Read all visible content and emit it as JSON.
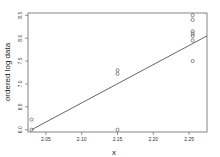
{
  "chart_data": {
    "type": "scatter",
    "title": "",
    "xlabel": "x",
    "ylabel": "ordered log data",
    "xlim": [
      2.025,
      2.275
    ],
    "ylim": [
      5.95,
      8.55
    ],
    "x_ticks": [
      2.05,
      2.1,
      2.15,
      2.2,
      2.25
    ],
    "x_tick_labels": [
      "2.05",
      "2.10",
      "2.15",
      "2.20",
      "2.25"
    ],
    "y_ticks": [
      6.0,
      6.5,
      7.0,
      7.5,
      8.0,
      8.5
    ],
    "y_tick_labels": [
      "6.0",
      "6.5",
      "7.0",
      "7.5",
      "8.0",
      "8.5"
    ],
    "grid": false,
    "legend": null,
    "points": [
      {
        "x": 2.03,
        "y": 6.0
      },
      {
        "x": 2.03,
        "y": 6.22
      },
      {
        "x": 2.15,
        "y": 6.0
      },
      {
        "x": 2.15,
        "y": 7.22
      },
      {
        "x": 2.15,
        "y": 7.3
      },
      {
        "x": 2.255,
        "y": 7.5
      },
      {
        "x": 2.255,
        "y": 7.95
      },
      {
        "x": 2.255,
        "y": 8.05
      },
      {
        "x": 2.255,
        "y": 8.1
      },
      {
        "x": 2.255,
        "y": 8.15
      },
      {
        "x": 2.255,
        "y": 8.4
      },
      {
        "x": 2.255,
        "y": 8.5
      }
    ],
    "fit_line": {
      "x": [
        2.03,
        2.275
      ],
      "y": [
        6.0,
        8.05
      ]
    },
    "colors": {
      "points": "#444444",
      "line": "#555555",
      "axes": "#666666"
    }
  }
}
